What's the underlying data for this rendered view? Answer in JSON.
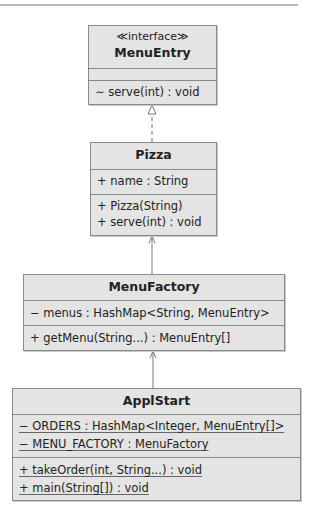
{
  "classes": {
    "menuentry": {
      "stereotype": "≪interface≫",
      "name": "MenuEntry",
      "attributes": [],
      "operations": [
        "∼ serve(int) : void"
      ]
    },
    "pizza": {
      "name": "Pizza",
      "attributes": [
        "+ name : String"
      ],
      "operations": [
        "+ Pizza(String)",
        "+ serve(int) : void"
      ]
    },
    "menufactory": {
      "name": "MenuFactory",
      "attributes": [
        "− menus : HashMap<String, MenuEntry>"
      ],
      "operations": [
        "+ getMenu(String...) : MenuEntry[]"
      ]
    },
    "applstart": {
      "name": "ApplStart",
      "attributes": [
        "− ORDERS : HashMap<Integer, MenuEntry[]>",
        "− MENU_FACTORY : MenuFactory"
      ],
      "operations": [
        "+ takeOrder(int, String...) : void",
        "+ main(String[]) : void"
      ]
    }
  },
  "relations": [
    {
      "from": "Pizza",
      "to": "MenuEntry",
      "type": "realization"
    },
    {
      "from": "MenuFactory",
      "to": "Pizza",
      "type": "dependency"
    },
    {
      "from": "ApplStart",
      "to": "MenuFactory",
      "type": "dependency"
    }
  ]
}
